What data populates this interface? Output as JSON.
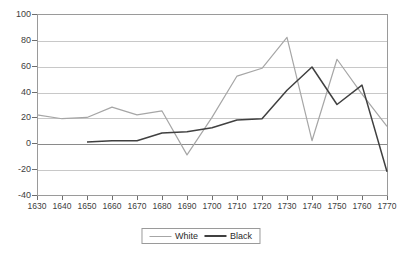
{
  "chart_data": {
    "type": "line",
    "title": "",
    "xlabel": "",
    "ylabel": "",
    "x": [
      1630,
      1640,
      1650,
      1660,
      1670,
      1680,
      1690,
      1700,
      1710,
      1720,
      1730,
      1740,
      1750,
      1760,
      1770
    ],
    "xtick_labels": [
      "1630",
      "1640",
      "1650",
      "1660",
      "1670",
      "1680",
      "1690",
      "1700",
      "1710",
      "1720",
      "1730",
      "1740",
      "1750",
      "1760",
      "1770"
    ],
    "ytick_labels": [
      "100",
      "80",
      "60",
      "40",
      "20",
      "0",
      "-20",
      "-40"
    ],
    "yticks": [
      100,
      80,
      60,
      40,
      20,
      0,
      -20,
      -40
    ],
    "ylim": [
      -40,
      100
    ],
    "xlim": [
      1630,
      1770
    ],
    "grid": true,
    "legend_position": "bottom-center",
    "series": [
      {
        "name": "White",
        "color": "#a6a6a6",
        "values": [
          22,
          19,
          20,
          28,
          22,
          25,
          -9,
          20,
          52,
          58,
          82,
          2,
          65,
          38,
          13
        ]
      },
      {
        "name": "Black",
        "color": "#404040",
        "values": [
          null,
          null,
          1,
          2,
          2,
          8,
          9,
          12,
          18,
          19,
          41,
          59,
          30,
          45,
          -22
        ]
      }
    ]
  },
  "legend": {
    "entries": [
      {
        "label": "White",
        "color": "#a6a6a6"
      },
      {
        "label": "Black",
        "color": "#404040"
      }
    ]
  }
}
